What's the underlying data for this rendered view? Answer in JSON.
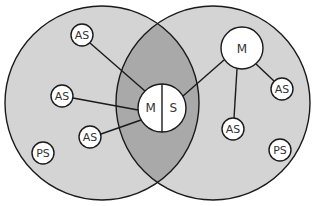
{
  "diagram": {
    "type": "venn-network",
    "colors": {
      "background": "#ffffff",
      "circle_fill": "#d4d4d4",
      "overlap_fill": "#a9a9a9",
      "stroke": "#1a1a1a",
      "node_fill": "#ffffff",
      "text": "#333333"
    },
    "sets": [
      {
        "id": "left",
        "cx": 102,
        "cy": 103,
        "r": 97
      },
      {
        "id": "right",
        "cx": 213,
        "cy": 103,
        "r": 97
      }
    ],
    "center_node": {
      "cx": 162,
      "cy": 108,
      "r": 24,
      "left_label": "M",
      "right_label": "S"
    },
    "nodes": [
      {
        "id": "as-left-top",
        "label": "AS",
        "cx": 82,
        "cy": 35,
        "r": 11
      },
      {
        "id": "as-left-mid",
        "label": "AS",
        "cx": 62,
        "cy": 96,
        "r": 11
      },
      {
        "id": "as-left-low",
        "label": "AS",
        "cx": 90,
        "cy": 137,
        "r": 11
      },
      {
        "id": "ps-left",
        "label": "PS",
        "cx": 43,
        "cy": 153,
        "r": 11
      },
      {
        "id": "m-right",
        "label": "M",
        "cx": 242,
        "cy": 48,
        "r": 21
      },
      {
        "id": "as-right-top",
        "label": "AS",
        "cx": 282,
        "cy": 89,
        "r": 11
      },
      {
        "id": "as-right-low",
        "label": "AS",
        "cx": 233,
        "cy": 129,
        "r": 11
      },
      {
        "id": "ps-right",
        "label": "PS",
        "cx": 280,
        "cy": 150,
        "r": 11
      }
    ],
    "edges": [
      {
        "from": "as-left-top",
        "to": "center-m",
        "x1": 90,
        "y1": 43,
        "x2": 145,
        "y2": 91
      },
      {
        "from": "as-left-mid",
        "to": "center-m",
        "x1": 73,
        "y1": 98,
        "x2": 138,
        "y2": 110
      },
      {
        "from": "as-left-low",
        "to": "center-m",
        "x1": 101,
        "y1": 134,
        "x2": 141,
        "y2": 120
      },
      {
        "from": "center-s",
        "to": "m-right",
        "x1": 183,
        "y1": 96,
        "x2": 224,
        "y2": 60
      },
      {
        "from": "m-right",
        "to": "as-right-top",
        "x1": 256,
        "y1": 64,
        "x2": 274,
        "y2": 81
      },
      {
        "from": "m-right",
        "to": "as-right-low",
        "x1": 237,
        "y1": 69,
        "x2": 234,
        "y2": 118
      }
    ]
  }
}
